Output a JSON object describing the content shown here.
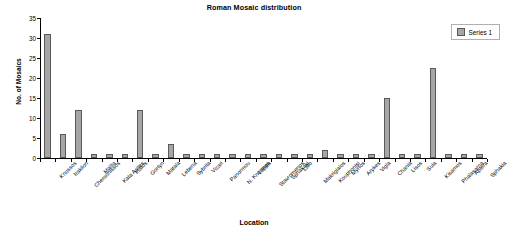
{
  "chart_data": {
    "type": "bar",
    "title": "Roman Mosaic distribution",
    "xlabel": "Location",
    "ylabel": "No. of Mosaics",
    "ylim": [
      0,
      35
    ],
    "ytick_step": 5,
    "yticks": [
      0,
      5,
      10,
      15,
      20,
      25,
      30,
      35
    ],
    "grid": false,
    "legend_position": "top-right",
    "categories": [
      "Knossos",
      "Iraklion",
      "Chersonissos",
      "Mallia",
      "Kata Asites",
      "Inatos",
      "Gortyn",
      "Matala",
      "Lebena",
      "Sybrita",
      "Vizari",
      "Panormou",
      "N. Knormas",
      "Lappa",
      "Stavromenos",
      "Sphakaki",
      "Lato",
      "Makrigialos",
      "Kouphonisi",
      "Myrtos",
      "Arykes",
      "Vigla",
      "Chania",
      "Lisos",
      "Suia",
      "Kisamos",
      "Phalasarna",
      "Aptera",
      "Sphakia"
    ],
    "series": [
      {
        "name": "Series 1",
        "color": "#a6a6a6",
        "values": [
          31,
          6,
          12,
          1,
          1,
          1,
          12,
          1,
          3.5,
          1,
          1,
          1,
          1,
          1,
          1,
          1,
          1,
          1,
          2,
          1,
          1,
          1,
          15,
          1,
          1,
          22.5,
          1,
          1,
          1
        ]
      }
    ]
  },
  "legend": {
    "swatch_name": "series-1-swatch",
    "label": "Series 1"
  }
}
